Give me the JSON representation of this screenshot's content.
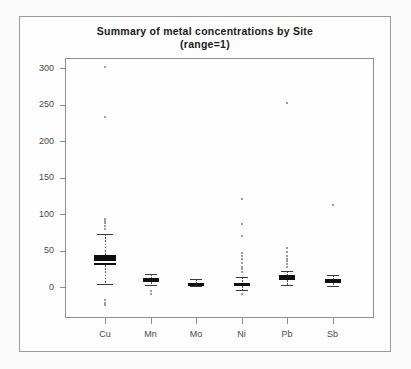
{
  "chart_data": {
    "type": "box",
    "title": "Summary of metal concentrations by Site",
    "subtitle": "(range=1)",
    "xlabel": "",
    "ylabel": "",
    "categories": [
      "Cu",
      "Mn",
      "Mo",
      "Ni",
      "Pb",
      "Sb"
    ],
    "yticks": [
      0,
      50,
      100,
      150,
      200,
      250,
      300
    ],
    "ylim": [
      -40,
      310
    ],
    "grid": false,
    "legend": "none",
    "boxes": [
      {
        "name": "Cu",
        "whisker_low": 4,
        "q1": 30,
        "median": 35,
        "q3": 44,
        "whisker_high": 72,
        "outliers": [
          301,
          233,
          93,
          90,
          87,
          83,
          80,
          -18,
          -22,
          -25
        ]
      },
      {
        "name": "Mn",
        "whisker_low": 3,
        "q1": 7,
        "median": 10,
        "q3": 12,
        "whisker_high": 18,
        "outliers": [
          -6,
          -9
        ]
      },
      {
        "name": "Mo",
        "whisker_low": 1,
        "q1": 3,
        "median": 5,
        "q3": 6,
        "whisker_high": 11,
        "outliers": []
      },
      {
        "name": "Ni",
        "whisker_low": -4,
        "q1": 1,
        "median": 3,
        "q3": 6,
        "whisker_high": 14,
        "outliers": [
          120,
          86,
          70,
          47,
          42,
          38,
          33,
          28,
          24,
          20,
          -9
        ]
      },
      {
        "name": "Pb",
        "whisker_low": 3,
        "q1": 10,
        "median": 13,
        "q3": 16,
        "whisker_high": 22,
        "outliers": [
          252,
          53,
          48,
          43,
          39,
          35,
          31,
          27
        ]
      },
      {
        "name": "Sb",
        "whisker_low": 2,
        "q1": 6,
        "median": 8,
        "q3": 11,
        "whisker_high": 17,
        "outliers": [
          112
        ]
      }
    ]
  },
  "axis": {
    "ytick_labels": [
      "300",
      "250",
      "200",
      "150",
      "100",
      "50",
      "0"
    ],
    "xtick_labels": [
      "Cu",
      "Mn",
      "Mo",
      "Ni",
      "Pb",
      "Sb"
    ]
  },
  "colors": {
    "background": "#fbfbfb",
    "frame": "#8d8d8d",
    "box_fill": "#0d0d0d",
    "text": "#1a1a1a",
    "tick_text": "#4a4a4a",
    "outlier": "#7d7d7d"
  }
}
